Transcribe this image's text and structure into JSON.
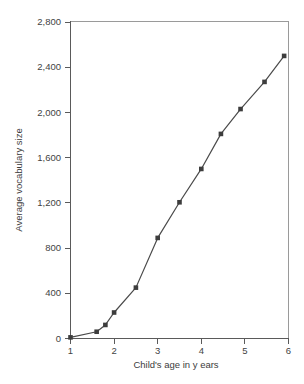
{
  "chart_data": {
    "type": "line",
    "title": "",
    "xlabel": "Child's age in y ears",
    "ylabel": "Average vocabulary size",
    "xlim": [
      0.75,
      6.05
    ],
    "ylim": [
      0,
      2800
    ],
    "xticks": [
      "1",
      "2",
      "3",
      "4",
      "5",
      "6"
    ],
    "xtick_values": [
      1,
      2,
      3,
      4,
      5,
      6
    ],
    "yticks": [
      "0",
      "400",
      "800",
      "1,200",
      "1,600",
      "2,000",
      "2,400",
      "2,800"
    ],
    "ytick_values": [
      0,
      400,
      800,
      1200,
      1600,
      2000,
      2400,
      2800
    ],
    "grid": false,
    "legend": "none",
    "marker": "filled-square",
    "line_color": "#4a4a4a",
    "marker_color": "#3d3d3d",
    "series": [
      {
        "name": "Average vocabulary size",
        "x": [
          1,
          1.6,
          1.8,
          2,
          2.5,
          3,
          3.5,
          4,
          4.45,
          4.9,
          5.45,
          5.9
        ],
        "values": [
          10,
          60,
          120,
          230,
          450,
          890,
          1205,
          1500,
          1810,
          2030,
          2270,
          2500
        ]
      }
    ]
  },
  "caption": {
    "text": ""
  }
}
